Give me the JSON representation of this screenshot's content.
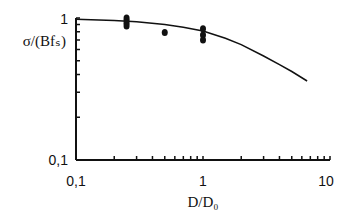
{
  "chart_data": {
    "type": "line",
    "title": "",
    "xlabel": "D/D₀",
    "ylabel": "σ/(Bfₛ)",
    "xscale": "log",
    "yscale": "log",
    "xlim": [
      0.1,
      10
    ],
    "ylim": [
      0.1,
      1
    ],
    "x_ticks": [
      "0,1",
      "1",
      "10"
    ],
    "y_ticks": [
      "0,1",
      "1"
    ],
    "grid": false,
    "legend": null,
    "series": [
      {
        "name": "model curve",
        "style": "line",
        "x": [
          0.1,
          0.2,
          0.3,
          0.5,
          0.7,
          1.0,
          1.5,
          2.0,
          3.0,
          4.0,
          5.0,
          6.6
        ],
        "y": [
          0.98,
          0.96,
          0.94,
          0.9,
          0.86,
          0.81,
          0.72,
          0.65,
          0.54,
          0.47,
          0.42,
          0.36
        ]
      },
      {
        "name": "measured",
        "style": "markers",
        "x": [
          0.25,
          0.25,
          0.25,
          0.25,
          0.5,
          1.0,
          1.0,
          1.0
        ],
        "y": [
          1.0,
          0.96,
          0.92,
          0.88,
          0.79,
          0.84,
          0.76,
          0.7
        ]
      }
    ]
  },
  "labels": {
    "y_axis": "σ/(Bfₛ)",
    "x_axis": "D/D₀",
    "y_top": "1",
    "y_bottom": "0,1",
    "x_left": "0,1",
    "x_mid": "1",
    "x_right": "10"
  }
}
